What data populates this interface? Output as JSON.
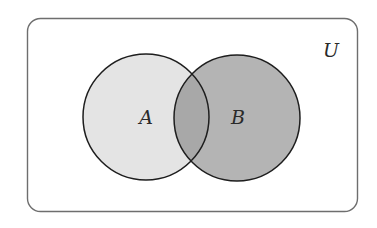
{
  "diagram": {
    "type": "venn",
    "universe": {
      "label": "U",
      "border_color": "#6e6e6e",
      "fill": "#ffffff"
    },
    "sets": [
      {
        "id": "A",
        "label": "A",
        "fill": "#e4e4e4",
        "stroke": "#1e1e1e"
      },
      {
        "id": "B",
        "label": "B",
        "fill": "#b4b4b4",
        "stroke": "#1e1e1e"
      }
    ],
    "intersection": {
      "sets": [
        "A",
        "B"
      ],
      "fill": "#a8a8a8"
    },
    "shaded_regions": [
      "B"
    ]
  }
}
